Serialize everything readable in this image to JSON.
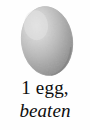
{
  "card": {
    "type": "recipe-ingredient-illustration",
    "background_color": "#fefefe",
    "width": 90,
    "height": 130
  },
  "illustration": {
    "icon_name": "egg-icon",
    "subject": "egg",
    "style": "grayscale shaded oval, light from upper-left",
    "colors": {
      "highlight": "#dcdcdc",
      "midtone": "#b4b4b4",
      "shadow": "#868686",
      "edge": "#9a9a9a"
    }
  },
  "caption": {
    "amount_line": "1 egg,",
    "prep_line": "beaten",
    "text_color": "#0d0d0d"
  }
}
